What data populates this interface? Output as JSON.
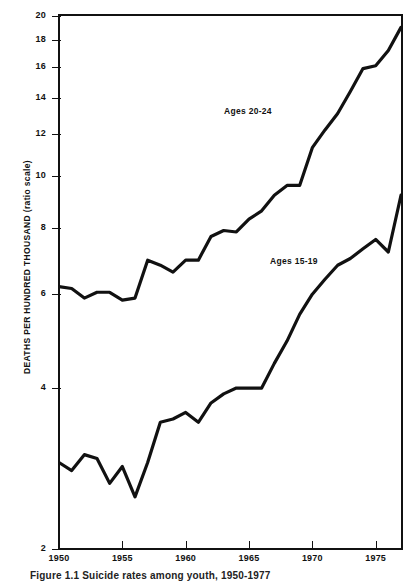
{
  "figure": {
    "caption": "Figure 1.1   Suicide rates among youth, 1950-1977",
    "ylabel_main": "DEATHS PER HUNDRED THOUSAND",
    "ylabel_note": "(ratio scale)"
  },
  "chart_data": {
    "type": "line",
    "title": "",
    "subtitle": "",
    "xlabel": "",
    "ylabel": "DEATHS PER HUNDRED THOUSAND (ratio scale)",
    "yscale": "log",
    "ylim": [
      2,
      20
    ],
    "xlim": [
      1950,
      1977
    ],
    "grid": false,
    "legend_position": "inline-annotation",
    "ytick_labels": [
      "2",
      "4",
      "6",
      "8",
      "10",
      "12",
      "14",
      "16",
      "18",
      "20"
    ],
    "yticks": [
      2,
      4,
      6,
      8,
      10,
      12,
      14,
      16,
      18,
      20
    ],
    "xtick_labels": [
      "1950",
      "1955",
      "1960",
      "1965",
      "1970",
      "1975"
    ],
    "xticks": [
      1950,
      1955,
      1960,
      1965,
      1970,
      1975
    ],
    "x": [
      1950,
      1951,
      1952,
      1953,
      1954,
      1955,
      1956,
      1957,
      1958,
      1959,
      1960,
      1961,
      1962,
      1963,
      1964,
      1965,
      1966,
      1967,
      1968,
      1969,
      1970,
      1971,
      1972,
      1973,
      1974,
      1975,
      1976,
      1977
    ],
    "series": [
      {
        "name": "Ages 20-24",
        "label": "Ages 20-24",
        "color": "#111111",
        "values": [
          6.2,
          6.15,
          5.9,
          6.05,
          6.05,
          5.85,
          5.9,
          6.95,
          6.8,
          6.6,
          6.95,
          6.95,
          7.7,
          7.9,
          7.85,
          8.3,
          8.6,
          9.2,
          9.6,
          9.6,
          11.3,
          12.2,
          13.1,
          14.4,
          15.9,
          16.1,
          17.2,
          19.0
        ]
      },
      {
        "name": "Ages 15-19",
        "label": "Ages 15-19",
        "color": "#111111",
        "values": [
          2.9,
          2.8,
          3.0,
          2.95,
          2.65,
          2.85,
          2.5,
          2.9,
          3.45,
          3.5,
          3.6,
          3.45,
          3.75,
          3.9,
          4.0,
          4.0,
          4.0,
          4.45,
          4.9,
          5.5,
          6.0,
          6.4,
          6.8,
          7.0,
          7.3,
          7.6,
          7.2,
          9.2
        ]
      }
    ],
    "annotations": [
      {
        "text": "Ages 20-24",
        "x": 1964.5,
        "y": 12.4
      },
      {
        "text": "Ages 15-19",
        "x": 1968.5,
        "y": 6.1
      }
    ]
  }
}
